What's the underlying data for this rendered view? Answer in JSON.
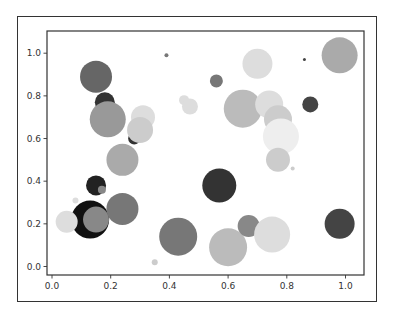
{
  "chart_data": {
    "type": "scatter",
    "title": "",
    "xlabel": "",
    "ylabel": "",
    "xlim": [
      -0.02,
      1.06
    ],
    "ylim": [
      -0.07,
      1.1
    ],
    "grid": false,
    "legend": null,
    "x_ticks": [
      "0.0",
      "0.2",
      "0.4",
      "0.6",
      "0.8",
      "1.0"
    ],
    "y_ticks": [
      "0.0",
      "0.2",
      "0.4",
      "0.6",
      "0.8",
      "1.0"
    ],
    "points": [
      {
        "x": 0.15,
        "y": 0.89,
        "r": 16,
        "color": "#666666"
      },
      {
        "x": 0.18,
        "y": 0.77,
        "r": 10,
        "color": "#333333"
      },
      {
        "x": 0.19,
        "y": 0.69,
        "r": 18,
        "color": "#999999"
      },
      {
        "x": 0.31,
        "y": 0.7,
        "r": 12,
        "color": "#dddddd"
      },
      {
        "x": 0.28,
        "y": 0.6,
        "r": 6,
        "color": "#333333"
      },
      {
        "x": 0.3,
        "y": 0.64,
        "r": 13,
        "color": "#cccccc"
      },
      {
        "x": 0.24,
        "y": 0.5,
        "r": 16,
        "color": "#aaaaaa"
      },
      {
        "x": 0.39,
        "y": 0.99,
        "r": 2,
        "color": "#777777"
      },
      {
        "x": 0.7,
        "y": 0.95,
        "r": 15,
        "color": "#dddddd"
      },
      {
        "x": 0.98,
        "y": 0.99,
        "r": 18,
        "color": "#aaaaaa"
      },
      {
        "x": 0.86,
        "y": 0.97,
        "r": 1.5,
        "color": "#444444"
      },
      {
        "x": 0.56,
        "y": 0.87,
        "r": 6.5,
        "color": "#777777"
      },
      {
        "x": 0.88,
        "y": 0.76,
        "r": 8,
        "color": "#444444"
      },
      {
        "x": 0.45,
        "y": 0.78,
        "r": 5,
        "color": "#dddddd"
      },
      {
        "x": 0.47,
        "y": 0.75,
        "r": 8,
        "color": "#dddddd"
      },
      {
        "x": 0.65,
        "y": 0.74,
        "r": 19,
        "color": "#bbbbbb"
      },
      {
        "x": 0.74,
        "y": 0.76,
        "r": 14,
        "color": "#dddddd"
      },
      {
        "x": 0.77,
        "y": 0.69,
        "r": 14,
        "color": "#cccccc"
      },
      {
        "x": 0.78,
        "y": 0.61,
        "r": 18,
        "color": "#eeeeee"
      },
      {
        "x": 0.77,
        "y": 0.5,
        "r": 12,
        "color": "#cccccc"
      },
      {
        "x": 0.82,
        "y": 0.46,
        "r": 2,
        "color": "#cccccc"
      },
      {
        "x": 0.15,
        "y": 0.38,
        "r": 10,
        "color": "#222222"
      },
      {
        "x": 0.17,
        "y": 0.36,
        "r": 4,
        "color": "#888888"
      },
      {
        "x": 0.13,
        "y": 0.22,
        "r": 19,
        "color": "#111111"
      },
      {
        "x": 0.15,
        "y": 0.22,
        "r": 13,
        "color": "#888888"
      },
      {
        "x": 0.05,
        "y": 0.21,
        "r": 11,
        "color": "#dddddd"
      },
      {
        "x": 0.24,
        "y": 0.27,
        "r": 16,
        "color": "#777777"
      },
      {
        "x": 0.08,
        "y": 0.31,
        "r": 3,
        "color": "#dddddd"
      },
      {
        "x": 0.35,
        "y": 0.02,
        "r": 3,
        "color": "#cccccc"
      },
      {
        "x": 0.57,
        "y": 0.38,
        "r": 17,
        "color": "#333333"
      },
      {
        "x": 0.43,
        "y": 0.14,
        "r": 19,
        "color": "#777777"
      },
      {
        "x": 0.6,
        "y": 0.09,
        "r": 19,
        "color": "#bbbbbb"
      },
      {
        "x": 0.67,
        "y": 0.19,
        "r": 11,
        "color": "#888888"
      },
      {
        "x": 0.75,
        "y": 0.15,
        "r": 18,
        "color": "#dddddd"
      },
      {
        "x": 0.98,
        "y": 0.2,
        "r": 15,
        "color": "#444444"
      }
    ]
  }
}
